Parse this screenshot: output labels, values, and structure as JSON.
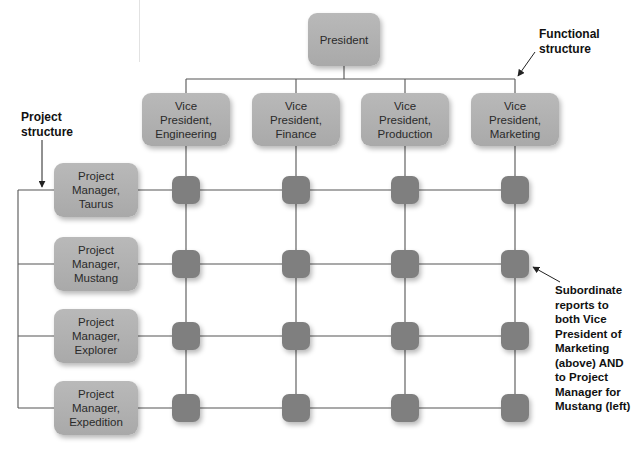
{
  "diagram": {
    "top": {
      "label": "President"
    },
    "vice_presidents": [
      {
        "label": "Vice\nPresident,\nEngineering"
      },
      {
        "label": "Vice\nPresident,\nFinance"
      },
      {
        "label": "Vice\nPresident,\nProduction"
      },
      {
        "label": "Vice\nPresident,\nMarketing"
      }
    ],
    "project_managers": [
      {
        "label": "Project\nManager,\nTaurus"
      },
      {
        "label": "Project\nManager,\nMustang"
      },
      {
        "label": "Project\nManager,\nExplorer"
      },
      {
        "label": "Project\nManager,\nExpedition"
      }
    ],
    "grid": {
      "rows": 4,
      "columns": 4,
      "node_color": "#7f7f7f"
    },
    "annotations": {
      "functional": "Functional\nstructure",
      "project": "Project\nstructure",
      "subordinate": "Subordinate\nreports to\nboth Vice\nPresident of\nMarketing\n(above) AND\nto Project\nManager for\nMustang (left)"
    },
    "colors": {
      "box": "#b0b0b0",
      "node": "#7f7f7f",
      "line": "#555555"
    }
  }
}
